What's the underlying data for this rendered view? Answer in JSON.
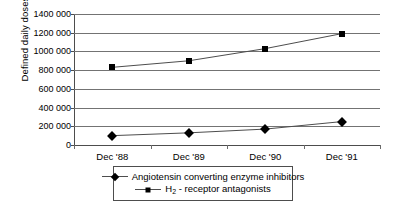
{
  "chart_data": {
    "type": "line",
    "title": "",
    "xlabel": "",
    "ylabel": "Defined daily doses",
    "categories": [
      "Dec '88",
      "Dec '89",
      "Dec '90",
      "Dec '91"
    ],
    "ylim": [
      0,
      1400000
    ],
    "ytick_values": [
      0,
      200000,
      400000,
      600000,
      800000,
      1000000,
      1200000,
      1400000
    ],
    "ytick_labels": [
      "0",
      "200 000",
      "400 000",
      "600 000",
      "800 000",
      "1000 000",
      "1200 000",
      "1400 000"
    ],
    "grid": "horizontal",
    "legend_position": "bottom",
    "series": [
      {
        "name": "Angiotensin converting enzyme inhibitors",
        "marker": "diamond",
        "values": [
          100000,
          130000,
          170000,
          250000
        ]
      },
      {
        "name": "H2 - receptor antagonists",
        "name_html": "H<sub>2</sub> - receptor antagonists",
        "marker": "square",
        "values": [
          830000,
          900000,
          1030000,
          1190000
        ]
      }
    ]
  },
  "axes": {
    "y_title": "Defined daily doses"
  },
  "legend": {
    "items": [
      {
        "label": "Angiotensin converting enzyme inhibitors",
        "marker": "diamond"
      },
      {
        "label_prefix": "H",
        "label_sub": "2",
        "label_suffix": " - receptor antagonists",
        "marker": "square"
      }
    ]
  },
  "colors": {
    "line": "#4d4d4d",
    "marker": "#000000",
    "grid": "#737373",
    "background": "#ffffff"
  }
}
